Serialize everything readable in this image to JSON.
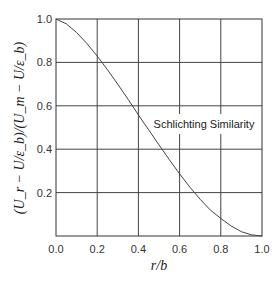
{
  "chart_data": {
    "type": "line",
    "title": "",
    "xlabel": "r/b",
    "ylabel": "(U_r − U/ε_b)/(U_m − U/ε_b)",
    "xlim": [
      0.0,
      1.0
    ],
    "ylim": [
      0.0,
      1.0
    ],
    "xticks": [
      "0.0",
      "0.2",
      "0.4",
      "0.6",
      "0.8",
      "1.0"
    ],
    "yticks": [
      "0.2",
      "0.4",
      "0.6",
      "0.8",
      "1.0"
    ],
    "grid": true,
    "legend": null,
    "annotations": [
      "Schlichting Similarity"
    ],
    "series": [
      {
        "name": "Schlichting Similarity",
        "x": [
          0.0,
          0.05,
          0.1,
          0.15,
          0.2,
          0.25,
          0.3,
          0.35,
          0.4,
          0.45,
          0.5,
          0.55,
          0.6,
          0.65,
          0.7,
          0.75,
          0.8,
          0.85,
          0.9,
          0.95,
          1.0
        ],
        "values": [
          1.0,
          0.978,
          0.938,
          0.887,
          0.829,
          0.766,
          0.699,
          0.63,
          0.558,
          0.489,
          0.42,
          0.352,
          0.286,
          0.225,
          0.169,
          0.119,
          0.081,
          0.046,
          0.02,
          0.005,
          0.0
        ]
      }
    ]
  },
  "labels": {
    "annotation": "Schlichting Similarity",
    "xlabel_r": "r",
    "xlabel_b": "b"
  }
}
